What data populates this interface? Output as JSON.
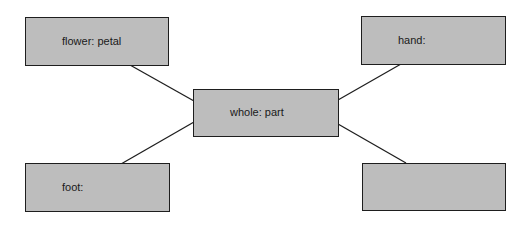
{
  "diagram": {
    "type": "analogy-map",
    "colors": {
      "box_fill": "#bdbdbd",
      "box_border": "#1e1e1e",
      "line": "#1e1e1e",
      "background": "#ffffff"
    },
    "center": {
      "label": "whole: part"
    },
    "nodes": [
      {
        "id": "top-left",
        "label": "flower: petal"
      },
      {
        "id": "top-right",
        "label": "hand:"
      },
      {
        "id": "bottom-left",
        "label": "foot:"
      },
      {
        "id": "bottom-right",
        "label": ""
      }
    ],
    "edges": [
      {
        "from": "center",
        "to": "top-left"
      },
      {
        "from": "center",
        "to": "top-right"
      },
      {
        "from": "center",
        "to": "bottom-left"
      },
      {
        "from": "center",
        "to": "bottom-right"
      }
    ]
  }
}
